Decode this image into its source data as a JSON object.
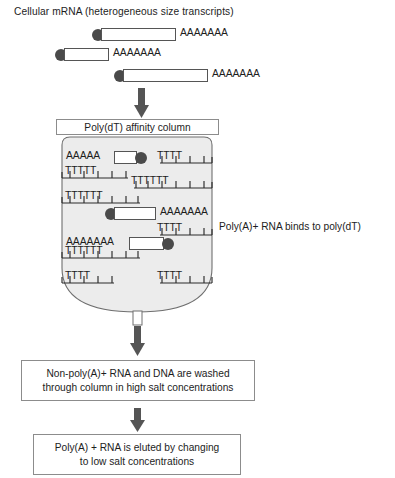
{
  "figure": {
    "title": "Cellular mRNA (heterogeneous size transcripts)",
    "poly_a_tail": "AAAAAAA",
    "column_label": "Poly(dT) affinity column",
    "binding_annotation": "Poly(A)+ RNA binds to poly(dT)",
    "colors": {
      "cap_fill": "#4a4a4a",
      "column_fill": "#ececec",
      "column_stroke": "#6f6f6f",
      "arrow_fill": "#555555",
      "box_stroke": "#8c8c8c",
      "text": "#1d1d1d"
    }
  },
  "transcripts": [
    {
      "id": "transcript-1",
      "cap": true,
      "tail": "AAAAAAA"
    },
    {
      "id": "transcript-2",
      "cap": true,
      "tail": "AAAAAAA"
    },
    {
      "id": "transcript-3",
      "cap": true,
      "tail": "AAAAAAA"
    }
  ],
  "column": {
    "label": "Poly(dT) affinity column",
    "bound_rna": [
      {
        "id": "bound-rna-1",
        "tail": "AAAAA",
        "tail_side": "left"
      },
      {
        "id": "bound-rna-2",
        "tail": "AAAAAAA",
        "tail_side": "right"
      },
      {
        "id": "bound-rna-3",
        "tail": "AAAAAAA",
        "tail_side": "left"
      }
    ],
    "poly_dt_combs": [
      {
        "id": "comb-left-1",
        "label": "TTTTT",
        "side": "left",
        "teeth": 5
      },
      {
        "id": "comb-left-2",
        "label": "TTTTTT",
        "side": "left",
        "teeth": 6
      },
      {
        "id": "comb-left-3",
        "label": "TTTTTT",
        "side": "left",
        "teeth": 6
      },
      {
        "id": "comb-left-4",
        "label": "TTTT",
        "side": "left",
        "teeth": 4
      },
      {
        "id": "comb-right-1",
        "label": "TTTT",
        "side": "right",
        "teeth": 4
      },
      {
        "id": "comb-right-2",
        "label": "TTTTTT",
        "side": "right",
        "teeth": 6
      },
      {
        "id": "comb-right-3",
        "label": "TTTT",
        "side": "right",
        "teeth": 4
      },
      {
        "id": "comb-right-4",
        "label": "TTTT",
        "side": "right",
        "teeth": 4
      }
    ]
  },
  "steps": [
    {
      "id": "step-wash",
      "line1": "Non-poly(A)+ RNA and DNA are washed",
      "line2": "through column in high salt concentrations"
    },
    {
      "id": "step-elute",
      "line1": "Poly(A) + RNA is eluted by changing",
      "line2": "to low salt concentrations"
    }
  ]
}
